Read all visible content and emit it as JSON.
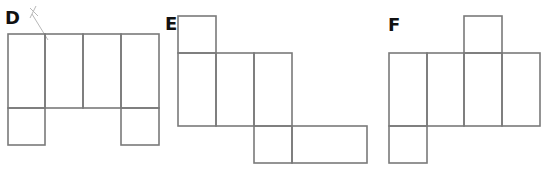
{
  "diagram": {
    "stroke_color": "#7a7a7a",
    "cell_size": 38,
    "nets": [
      {
        "label": "D",
        "label_pos": [
          5,
          24
        ],
        "cells": [
          [
            8,
            34,
            37,
            74
          ],
          [
            45,
            34,
            38,
            74
          ],
          [
            83,
            34,
            38,
            74
          ],
          [
            121,
            34,
            38,
            74
          ],
          [
            8,
            108,
            37,
            37
          ],
          [
            121,
            108,
            38,
            37
          ]
        ]
      },
      {
        "label": "E",
        "label_pos": [
          165,
          30
        ],
        "cells": [
          [
            178,
            16,
            38,
            37
          ],
          [
            178,
            53,
            38,
            73
          ],
          [
            216,
            53,
            38,
            73
          ],
          [
            254,
            53,
            38,
            73
          ],
          [
            254,
            126,
            38,
            37
          ],
          [
            292,
            126,
            75,
            37
          ]
        ]
      },
      {
        "label": "F",
        "label_pos": [
          388,
          31
        ],
        "cells": [
          [
            464,
            16,
            38,
            37
          ],
          [
            389,
            53,
            38,
            73
          ],
          [
            427,
            53,
            37,
            73
          ],
          [
            464,
            53,
            38,
            73
          ],
          [
            502,
            53,
            38,
            73
          ],
          [
            389,
            126,
            38,
            37
          ]
        ]
      }
    ],
    "pencil_marks": [
      "M30 8 L38 16 M36 6 L30 18 M32 14 L48 40"
    ]
  }
}
